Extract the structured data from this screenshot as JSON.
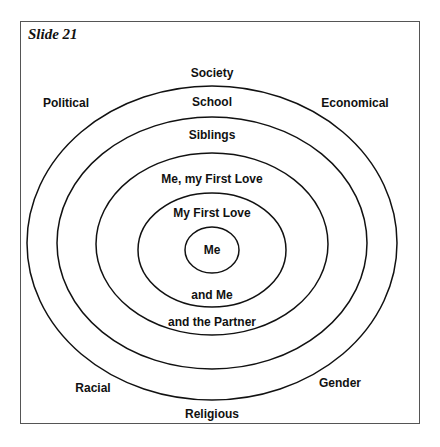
{
  "slide": {
    "title": "Slide 21"
  },
  "outer_labels": {
    "top": "Society",
    "top_left": "Political",
    "top_right": "Economical",
    "bottom_left": "Racial",
    "bottom_right": "Gender",
    "bottom": "Religious"
  },
  "rings": [
    {
      "label_top": "School",
      "label_bottom": ""
    },
    {
      "label_top": "Siblings",
      "label_bottom": ""
    },
    {
      "label_top": "Me, my First Love",
      "label_bottom": "and the Partner"
    },
    {
      "label_top": "My First Love",
      "label_bottom": "and Me"
    },
    {
      "label_top": "Me",
      "label_bottom": ""
    }
  ]
}
